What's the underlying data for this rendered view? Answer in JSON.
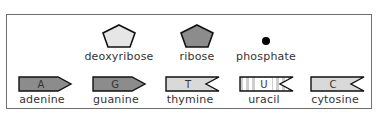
{
  "legend": {
    "sugars_and_phosphate": [
      {
        "name": "deoxyribose",
        "shape": "pentagon",
        "fill": "#e6e6e6"
      },
      {
        "name": "ribose",
        "shape": "pentagon",
        "fill": "#8c8c8c"
      },
      {
        "name": "phosphate",
        "shape": "dot",
        "fill": "#000000"
      }
    ],
    "bases": [
      {
        "name": "adenine",
        "letter": "A",
        "shape": "arrow-point",
        "fill": "#8c8c8c"
      },
      {
        "name": "guanine",
        "letter": "G",
        "shape": "arrow-point",
        "fill": "#8c8c8c"
      },
      {
        "name": "thymine",
        "letter": "T",
        "shape": "notch",
        "fill": "#d9d9d9"
      },
      {
        "name": "uracil",
        "letter": "U",
        "shape": "notch-striped",
        "fill": "#e0e0e0"
      },
      {
        "name": "cytosine",
        "letter": "C",
        "shape": "notch",
        "fill": "#d9d9d9"
      }
    ]
  },
  "colors": {
    "border": "#6f6f6f",
    "dark_fill": "#8c8c8c",
    "light_fill": "#e6e6e6",
    "outline": "#111111"
  }
}
